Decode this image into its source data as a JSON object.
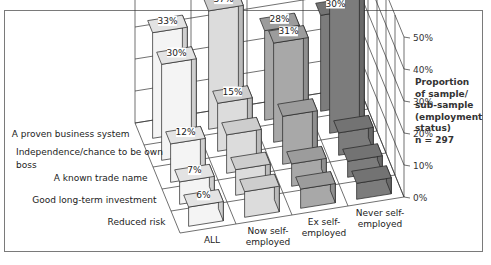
{
  "chart_data": {
    "type": "bar",
    "subtype": "3d-grouped",
    "title": "",
    "categories": [
      "A proven business system",
      "Independence/chance to be own boss",
      "A known trade name",
      "Good long-term investment",
      "Reduced risk"
    ],
    "series": [
      {
        "name": "ALL",
        "values": [
          33,
          30,
          12,
          7,
          6
        ],
        "color": "#f4f4f4"
      },
      {
        "name": "Now self-employed",
        "values": [
          37,
          15,
          12,
          8,
          8
        ],
        "color": "#dcdcdc"
      },
      {
        "name": "Ex self-employed",
        "values": [
          28,
          31,
          15,
          7,
          6
        ],
        "color": "#a8a8a8"
      },
      {
        "name": "Never self-employed",
        "values": [
          30,
          43,
          7,
          5,
          5
        ],
        "color": "#7c7c7c"
      }
    ],
    "data_labels": [
      {
        "series": "ALL",
        "category": "A proven business system",
        "text": "33%"
      },
      {
        "series": "ALL",
        "category": "Independence/chance to be own boss",
        "text": "30%"
      },
      {
        "series": "ALL",
        "category": "A known trade name",
        "text": "12%"
      },
      {
        "series": "ALL",
        "category": "Good long-term investment",
        "text": "7%"
      },
      {
        "series": "ALL",
        "category": "Reduced risk",
        "text": "6%"
      },
      {
        "series": "Now self-employed",
        "category": "A proven business system",
        "text": "37%"
      },
      {
        "series": "Now self-employed",
        "category": "Independence/chance to be own boss",
        "text": "15%"
      },
      {
        "series": "Ex self-employed",
        "category": "A proven business system",
        "text": "28%"
      },
      {
        "series": "Ex self-employed",
        "category": "Independence/chance to be own boss",
        "text": "31%"
      },
      {
        "series": "Never self-employed",
        "category": "A proven business system",
        "text": "30%"
      },
      {
        "series": "Never self-employed",
        "category": "Independence/chance to be own boss",
        "text": "43%"
      }
    ],
    "xlabel": "",
    "ylabel": "Proportion of sample/ sub-sample (employment status) n = 297",
    "yticks": [
      "0%",
      "10%",
      "20%",
      "30%",
      "40%",
      "50%"
    ],
    "ylim": [
      0,
      50
    ],
    "grid": true,
    "legend": "none (series labelled on depth axis)"
  },
  "labels": {
    "rows": [
      "A proven business system",
      "Independence/chance to be own",
      "boss",
      "A known trade name",
      "Good long-term investment",
      "Reduced risk"
    ],
    "columns": [
      [
        "ALL"
      ],
      [
        "Now self-",
        "employed"
      ],
      [
        "Ex self-",
        "employed"
      ],
      [
        "Never self-",
        "employed"
      ]
    ],
    "yticks": [
      "0%",
      "10%",
      "20%",
      "30%",
      "40%",
      "50%"
    ],
    "axis_title_lines": [
      "Proportion",
      "of sample/",
      "sub-sample",
      "(employment",
      "status)"
    ],
    "n_label": "n = 297"
  }
}
